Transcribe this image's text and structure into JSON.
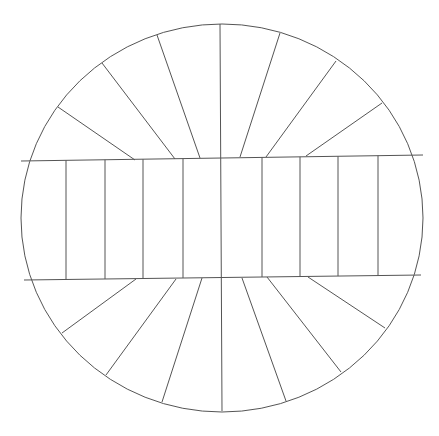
{
  "diagram": {
    "stroke_color": "#555555",
    "background": "#ffffff",
    "ellipse": {
      "cx": 222,
      "cy": 218,
      "rx": 201,
      "ry": 194
    },
    "band": {
      "top_line": [
        [
          21,
          161
        ],
        [
          423,
          155
        ]
      ],
      "bottom_line": [
        [
          24,
          280
        ],
        [
          421,
          275
        ]
      ]
    },
    "band_dividers_x": [
      66,
      105,
      143,
      183,
      262,
      300,
      338,
      378
    ],
    "center_line": [
      [
        220,
        24
      ],
      [
        222,
        411
      ]
    ],
    "top_radials": [
      [
        [
          135,
          160
        ],
        [
          58,
          107
        ]
      ],
      [
        [
          175,
          159
        ],
        [
          102,
          63
        ]
      ],
      [
        [
          200,
          158
        ],
        [
          157,
          35
        ]
      ],
      [
        [
          240,
          157
        ],
        [
          280,
          33
        ]
      ],
      [
        [
          266,
          157
        ],
        [
          336,
          61
        ]
      ],
      [
        [
          306,
          156
        ],
        [
          382,
          103
        ]
      ]
    ],
    "bottom_radials": [
      [
        [
          136,
          279
        ],
        [
          62,
          333
        ]
      ],
      [
        [
          176,
          279
        ],
        [
          106,
          375
        ]
      ],
      [
        [
          202,
          278
        ],
        [
          162,
          402
        ]
      ],
      [
        [
          242,
          278
        ],
        [
          286,
          401
        ]
      ],
      [
        [
          267,
          277
        ],
        [
          341,
          372
        ]
      ],
      [
        [
          308,
          277
        ],
        [
          385,
          328
        ]
      ]
    ]
  }
}
